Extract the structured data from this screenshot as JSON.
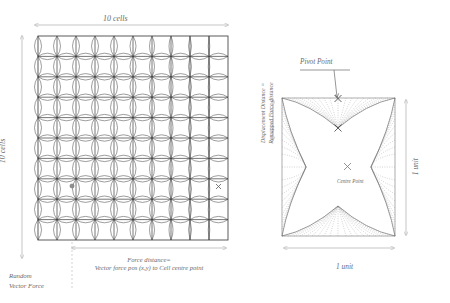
{
  "figure": {
    "left_panel": {
      "top_axis_label": "10 cells",
      "left_axis_label": "10 cells",
      "grid": {
        "cols": 10,
        "rows": 10
      },
      "force_distance_label_line1": "Force distance=",
      "force_distance_label_line2": "Vector force pos (x,y) to Cell centre point",
      "random_force_label_line1": "Random",
      "random_force_label_line2": "Vector Force",
      "marker_names": [
        "random-vector-force-dot",
        "cell-centre-cross"
      ]
    },
    "middle_axis": {
      "label_line1": "Displacement Distance =",
      "label_line2": "Remapped Force distance"
    },
    "right_panel": {
      "pivot_point_label": "Pivot Point",
      "centre_point_label": "Centre Point",
      "width_label": "1 unit",
      "height_label": "1 unit",
      "marker_names": [
        "pivot-point-cross",
        "inner-pivot-cross",
        "centre-point-cross"
      ]
    },
    "colors": {
      "ink": "#3a3a3a",
      "text": "#6b6b6b",
      "arrow": "#b6b6b6",
      "dotted": "#9a9a9a",
      "grid": "#4a4a4a"
    }
  }
}
